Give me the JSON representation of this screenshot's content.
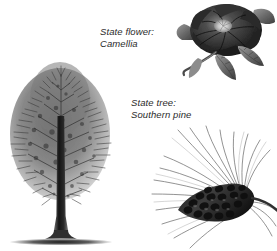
{
  "page": {
    "background_color": "#ffffff",
    "ink_color": "#2b2b2b",
    "style": "grayscale engraving illustration"
  },
  "labels": {
    "flower": {
      "line1": "State flower:",
      "line2": "Camellia"
    },
    "tree": {
      "line1": "State tree:",
      "line2": "Southern pine"
    }
  },
  "figures": {
    "tree": {
      "name": "southern pine tree",
      "description": "tall conical pine tree with dense needled crown, straight bare trunk and ground shadow"
    },
    "flower": {
      "name": "camellia blossom",
      "description": "dark many-petaled camellia flower with pale center, leaves and stem"
    },
    "branch": {
      "name": "pine cone with needles",
      "description": "pine cone on a branch with long sweeping needles fanning to the left"
    }
  }
}
